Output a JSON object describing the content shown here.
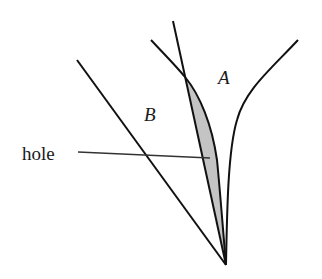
{
  "diagram": {
    "labels": {
      "region_a": "A",
      "region_b": "B",
      "hole": "hole"
    },
    "colors": {
      "stroke": "#111111",
      "hole_fill": "#c4c4c4",
      "background": "#ffffff"
    },
    "elements": [
      {
        "name": "line-b",
        "description": "straight line from upper-left to apex"
      },
      {
        "name": "line-steep",
        "description": "steep straight line from top to apex"
      },
      {
        "name": "curve-a-left",
        "description": "left boundary curve of region A"
      },
      {
        "name": "curve-a-right",
        "description": "right boundary curve of region A"
      },
      {
        "name": "hole-region",
        "description": "shaded lens-shaped hole between steep line and left curve"
      },
      {
        "name": "hole-leader-line",
        "description": "leader line from 'hole' label to shaded region"
      }
    ]
  }
}
